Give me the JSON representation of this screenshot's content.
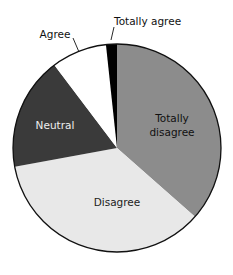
{
  "chart_data": {
    "type": "pie",
    "title": "",
    "categories": [
      "Totally disagree",
      "Disagree",
      "Neutral",
      "Agree",
      "Totally agree"
    ],
    "values": [
      36.5,
      35.6,
      17.6,
      8.6,
      1.7
    ],
    "unit": "percent (estimated from slice angles)",
    "start_angle": "12 o'clock, clockwise",
    "colors": [
      "#8c8c8c",
      "#e8e8e8",
      "#3a3a3a",
      "#ffffff",
      "#000000"
    ],
    "legend": "none (inline labels)"
  },
  "labels": {
    "totally_disagree_line1": "Totally",
    "totally_disagree_line2": "disagree",
    "disagree": "Disagree",
    "neutral": "Neutral",
    "agree": "Agree",
    "totally_agree": "Totally agree"
  }
}
